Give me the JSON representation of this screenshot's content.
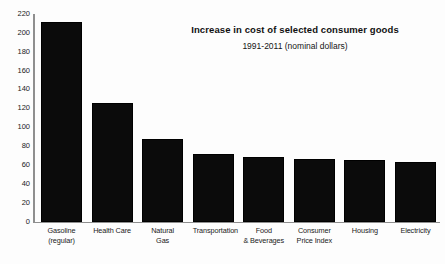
{
  "chart_data": {
    "type": "bar",
    "title": "Increase in cost of selected consumer goods",
    "subtitle": "1991-2011 (nominal dollars)",
    "xlabel": "",
    "ylabel": "",
    "ylim": [
      0,
      220
    ],
    "grid": false,
    "legend": "none",
    "orientation": "vertical",
    "bar_color": "#0b0b0b",
    "axis_color": "#8f8f8f",
    "categories": [
      "Gasoline (regular)",
      "Health Care",
      "Natural Gas",
      "Transportation",
      "Food & Beverages",
      "Consumer Price Index",
      "Housing",
      "Electricity"
    ],
    "category_lines": [
      [
        "Gasoline",
        "(regular)"
      ],
      [
        "Health Care",
        ""
      ],
      [
        "Natural",
        "Gas"
      ],
      [
        "Transportation",
        ""
      ],
      [
        "Food",
        "& Beverages"
      ],
      [
        "Consumer",
        "Price Index"
      ],
      [
        "Housing",
        ""
      ],
      [
        "Electricity",
        ""
      ]
    ],
    "values": [
      212,
      126,
      88,
      72,
      68,
      66,
      65,
      63
    ],
    "yticks": [
      220,
      200,
      180,
      160,
      140,
      120,
      100,
      80,
      60,
      40,
      20,
      0
    ],
    "ytick_labels": [
      "220",
      "200",
      "180",
      "160",
      "140",
      "120",
      "100",
      "80",
      "60",
      "40",
      "20",
      "0"
    ]
  }
}
